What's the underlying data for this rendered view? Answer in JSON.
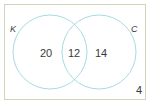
{
  "diagram": {
    "type": "venn",
    "universe_border_color": "#cfd6b8",
    "circle_color": "#a8dbe2",
    "sets": [
      {
        "id": "K",
        "label": "K"
      },
      {
        "id": "C",
        "label": "C"
      }
    ],
    "regions": {
      "only_K": "20",
      "K_and_C": "12",
      "only_C": "14",
      "neither": "4"
    }
  }
}
